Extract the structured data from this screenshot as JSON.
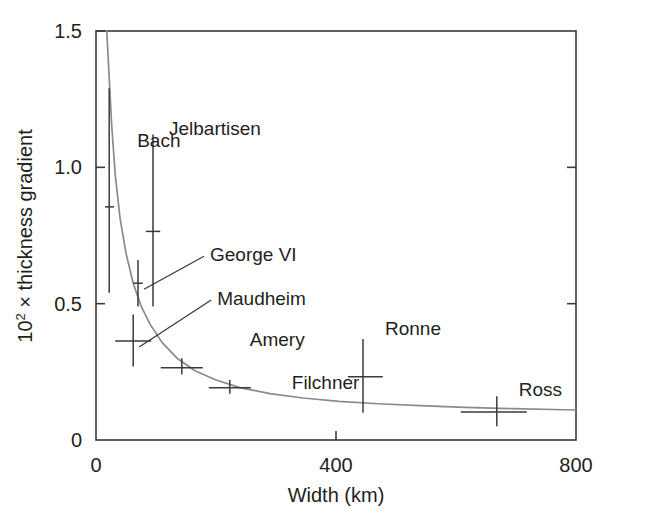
{
  "chart_data": {
    "type": "scatter",
    "title": "",
    "xlabel": "Width (km)",
    "ylabel": "10² × thickness gradient",
    "ylabel_base": "10",
    "ylabel_exp": "2",
    "ylabel_rest": " × thickness gradient",
    "xlim": [
      0,
      800
    ],
    "ylim": [
      0,
      1.5
    ],
    "xticks": [
      0,
      400,
      800
    ],
    "xtick_labels": [
      "0",
      "400",
      "800"
    ],
    "yticks": [
      0,
      0.5,
      1.0,
      1.5
    ],
    "ytick_labels": [
      "0",
      "0.5",
      "1.0",
      "1.5"
    ],
    "grid": false,
    "legend": "none",
    "frame": "box",
    "series": [
      {
        "name": "Ice shelves",
        "marker": "cross-with-errorbars",
        "color": "#3a3a3a",
        "points": [
          {
            "label": "Bach",
            "x": 22,
            "y": 0.855,
            "yerr_low": 0.54,
            "yerr_high": 1.29,
            "xerr_low": 15,
            "xerr_high": 30,
            "label_dx": 28,
            "label_dy": -60,
            "leader": false
          },
          {
            "label": "Jelbartisen",
            "x": 95,
            "y": 0.765,
            "yerr_low": 0.49,
            "yerr_high": 1.12,
            "xerr_low": 83,
            "xerr_high": 107,
            "label_dx": 16,
            "label_dy": -96,
            "leader": false
          },
          {
            "label": "George VI",
            "x": 70,
            "y": 0.575,
            "yerr_low": 0.49,
            "yerr_high": 0.66,
            "xerr_low": 62,
            "xerr_high": 78,
            "label_dx": 72,
            "label_dy": -22,
            "leader": true
          },
          {
            "label": "Maudheim",
            "x": 62,
            "y": 0.363,
            "yerr_low": 0.27,
            "yerr_high": 0.46,
            "xerr_low": 32,
            "xerr_high": 92,
            "label_dx": 84,
            "label_dy": -36,
            "leader": true
          },
          {
            "label": "Amery",
            "x": 143,
            "y": 0.265,
            "yerr_low": 0.24,
            "yerr_high": 0.3,
            "xerr_low": 108,
            "xerr_high": 178,
            "label_dx": 68,
            "label_dy": -22,
            "leader": false
          },
          {
            "label": "Filchner",
            "x": 223,
            "y": 0.192,
            "yerr_low": 0.17,
            "yerr_high": 0.22,
            "xerr_low": 188,
            "xerr_high": 258,
            "label_dx": 62,
            "label_dy": 1,
            "leader": false
          },
          {
            "label": "Ronne",
            "x": 445,
            "y": 0.232,
            "yerr_low": 0.1,
            "yerr_high": 0.37,
            "xerr_low": 420,
            "xerr_high": 478,
            "label_dx": 22,
            "label_dy": -42,
            "leader": false
          },
          {
            "label": "Ross",
            "x": 668,
            "y": 0.103,
            "yerr_low": 0.05,
            "yerr_high": 0.16,
            "xerr_low": 608,
            "xerr_high": 718,
            "label_dx": 22,
            "label_dy": -16,
            "leader": false
          }
        ]
      },
      {
        "name": "fitted curve",
        "marker": "line",
        "color": "#8a8a8a",
        "curve_note": "inverse power-law fit through points",
        "x": [
          18,
          22,
          26,
          32,
          40,
          50,
          62,
          75,
          90,
          110,
          135,
          165,
          200,
          240,
          290,
          345,
          405,
          470,
          540,
          615,
          695,
          780,
          800
        ],
        "y": [
          1.5,
          1.33,
          1.16,
          0.975,
          0.815,
          0.685,
          0.575,
          0.492,
          0.425,
          0.358,
          0.3,
          0.254,
          0.22,
          0.192,
          0.17,
          0.154,
          0.142,
          0.133,
          0.126,
          0.12,
          0.115,
          0.111,
          0.11
        ]
      }
    ]
  },
  "figure": {
    "background": "#ffffff",
    "axis_color": "#3a3a3a",
    "curve_color": "#8a8a8a",
    "text_color": "#231f20"
  }
}
